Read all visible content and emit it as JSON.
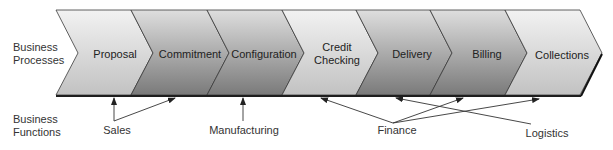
{
  "row_labels": {
    "processes": [
      "Business",
      "Processes"
    ],
    "functions": [
      "Business",
      "Functions"
    ]
  },
  "stages": [
    {
      "label": "Proposal",
      "lines": [
        "Proposal"
      ],
      "shade": "light"
    },
    {
      "label": "Commitment",
      "lines": [
        "Commitment"
      ],
      "shade": "dark"
    },
    {
      "label": "Configuration",
      "lines": [
        "Configuration"
      ],
      "shade": "dark"
    },
    {
      "label": "Credit Checking",
      "lines": [
        "Credit",
        "Checking"
      ],
      "shade": "light"
    },
    {
      "label": "Delivery",
      "lines": [
        "Delivery"
      ],
      "shade": "dark"
    },
    {
      "label": "Billing",
      "lines": [
        "Billing"
      ],
      "shade": "dark"
    },
    {
      "label": "Collections",
      "lines": [
        "Collections"
      ],
      "shade": "light"
    }
  ],
  "functions": [
    {
      "label": "Sales",
      "targets": [
        "Proposal",
        "Commitment"
      ]
    },
    {
      "label": "Manufacturing",
      "targets": [
        "Configuration"
      ]
    },
    {
      "label": "Finance",
      "targets": [
        "Credit Checking",
        "Billing",
        "Collections"
      ]
    },
    {
      "label": "Logistics",
      "targets": [
        "Delivery"
      ]
    }
  ],
  "colors": {
    "light_top": "#f0f0f0",
    "light_bottom": "#c4c4c4",
    "dark_top": "#dcdcdc",
    "dark_bottom": "#7c7c7c",
    "outline": "#3a3a3a",
    "baseline": "#1e1e1e",
    "arrow": "#333333"
  }
}
